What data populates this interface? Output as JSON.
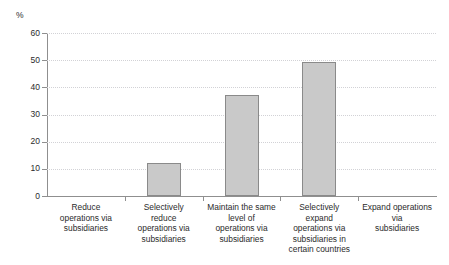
{
  "chart_data": {
    "type": "bar",
    "title": "",
    "subtitle": "",
    "xlabel": "",
    "ylabel": "%",
    "unit_label": "%",
    "ylim": [
      0,
      60
    ],
    "ytick_step": 10,
    "yticks": [
      60,
      50,
      40,
      30,
      20,
      10,
      0
    ],
    "ytick_labels": [
      "60",
      "50",
      "40",
      "30",
      "20",
      "10",
      "0"
    ],
    "grid": true,
    "grid_axis": "y",
    "grid_style": "dotted",
    "legend": false,
    "legend_position": "none",
    "categories": [
      "Reduce operations via subsidiaries",
      "Selectively reduce operations via subsidiaries",
      "Maintain the same level of operations via subsidiaries",
      "Selectively expand operations via subsidiaries in certain countries",
      "Expand operations via subsidiaries"
    ],
    "category_lines": [
      [
        "Reduce",
        "operations via",
        "subsidiaries"
      ],
      [
        "Selectively",
        "reduce",
        "operations via",
        "subsidiaries"
      ],
      [
        "Maintain the same",
        "level of",
        "operations via",
        "subsidiaries"
      ],
      [
        "Selectively",
        "expand",
        "operations via",
        "subsidiaries in",
        "certain countries"
      ],
      [
        "Expand operations",
        "via",
        "subsidiaries"
      ]
    ],
    "values": [
      0,
      12.3,
      37,
      49.5,
      0
    ],
    "colors": {
      "bar_fill": "#c9c9c9",
      "bar_border": "#8a8a8a",
      "axis": "#8f8f8f",
      "gridline": "#d2d2d6",
      "text": "#2b2b2b",
      "background": "#ffffff"
    }
  }
}
